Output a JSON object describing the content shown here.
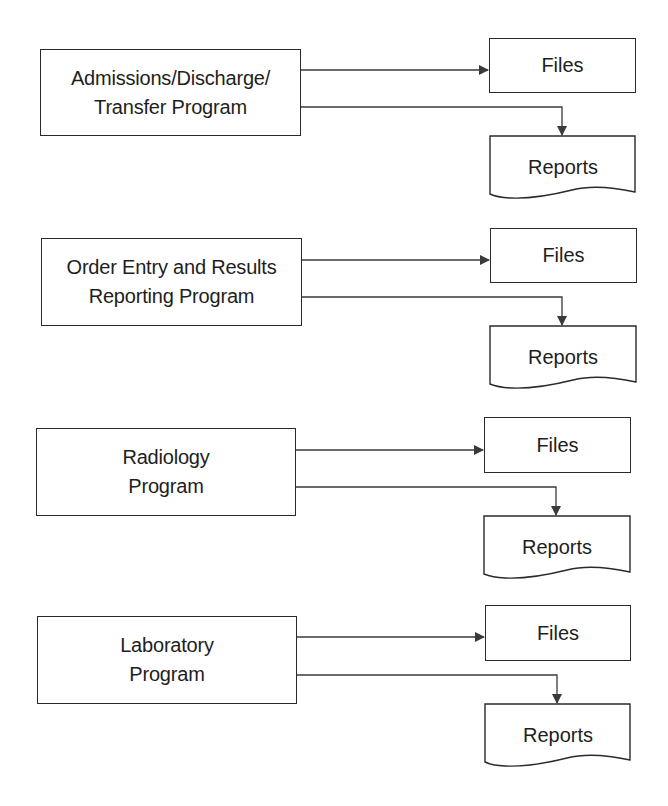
{
  "diagram": {
    "title": "",
    "programs": [
      {
        "id": "adt",
        "line1": "Admissions/Discharge/",
        "line2": "Transfer Program",
        "files_label": "Files",
        "reports_label": "Reports"
      },
      {
        "id": "order-entry",
        "line1": "Order Entry and Results",
        "line2": "Reporting Program",
        "files_label": "Files",
        "reports_label": "Reports"
      },
      {
        "id": "radiology",
        "line1": "Radiology",
        "line2": "Program",
        "files_label": "Files",
        "reports_label": "Reports"
      },
      {
        "id": "laboratory",
        "line1": "Laboratory",
        "line2": "Program",
        "files_label": "Files",
        "reports_label": "Reports"
      }
    ],
    "colors": {
      "stroke": "#2a2a2a",
      "arrow": "#3a3a3a",
      "text": "#1e1e1e",
      "background": "#ffffff"
    }
  }
}
